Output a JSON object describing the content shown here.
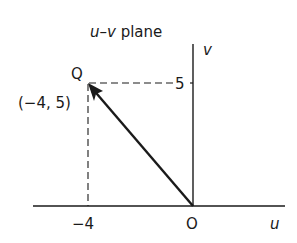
{
  "title": {
    "var_u": "u",
    "dash": "–",
    "var_v": "v",
    "rest": " plane"
  },
  "axes": {
    "u_label": "u",
    "v_label": "v",
    "origin_label": "O"
  },
  "ticks": {
    "u_tick": "−4",
    "v_tick": "5"
  },
  "point": {
    "name": "Q",
    "coords": "(−4, 5)",
    "u": -4,
    "v": 5
  },
  "colors": {
    "ink": "#1a1a1a",
    "background": "#ffffff"
  }
}
